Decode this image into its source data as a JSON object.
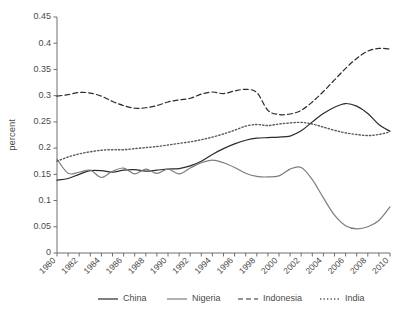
{
  "chart_data": {
    "type": "line",
    "title": "",
    "xlabel": "",
    "ylabel": "percent",
    "xlim": [
      1980,
      2010
    ],
    "ylim": [
      0,
      0.45
    ],
    "grid": false,
    "legend_position": "bottom",
    "y_ticks": [
      "0",
      "0.05",
      "0.1",
      "0.15",
      "0.2",
      "0.25",
      "0.3",
      "0.35",
      "0.4",
      "0.45"
    ],
    "y_tick_values": [
      0,
      0.05,
      0.1,
      0.15,
      0.2,
      0.25,
      0.3,
      0.35,
      0.4,
      0.45
    ],
    "x_tick_labels": [
      "1980",
      "1982",
      "1984",
      "1986",
      "1988",
      "1990",
      "1992",
      "1994",
      "1996",
      "1998",
      "2000",
      "2002",
      "2004",
      "2006",
      "2008",
      "2010"
    ],
    "x_tick_values": [
      1980,
      1982,
      1984,
      1986,
      1988,
      1990,
      1992,
      1994,
      1996,
      1998,
      2000,
      2002,
      2004,
      2006,
      2008,
      2010
    ],
    "x": [
      1980,
      1981,
      1982,
      1983,
      1984,
      1985,
      1986,
      1987,
      1988,
      1989,
      1990,
      1991,
      1992,
      1993,
      1994,
      1995,
      1996,
      1997,
      1998,
      1999,
      2000,
      2001,
      2002,
      2003,
      2004,
      2005,
      2006,
      2007,
      2008,
      2009,
      2010
    ],
    "series": [
      {
        "name": "China",
        "style": "solid",
        "color": "#2b2b2b",
        "values": [
          0.139,
          0.142,
          0.15,
          0.157,
          0.157,
          0.154,
          0.158,
          0.159,
          0.156,
          0.158,
          0.16,
          0.161,
          0.166,
          0.175,
          0.188,
          0.199,
          0.208,
          0.215,
          0.219,
          0.22,
          0.221,
          0.223,
          0.233,
          0.25,
          0.266,
          0.278,
          0.285,
          0.28,
          0.266,
          0.245,
          0.232
        ]
      },
      {
        "name": "Nigeria",
        "style": "solid",
        "color": "#7d7d7d",
        "values": [
          0.179,
          0.152,
          0.154,
          0.158,
          0.144,
          0.156,
          0.162,
          0.151,
          0.16,
          0.152,
          0.16,
          0.151,
          0.162,
          0.172,
          0.177,
          0.172,
          0.163,
          0.152,
          0.146,
          0.145,
          0.147,
          0.16,
          0.163,
          0.14,
          0.105,
          0.072,
          0.052,
          0.046,
          0.05,
          0.062,
          0.088
        ]
      },
      {
        "name": "Indonesia",
        "style": "dashed",
        "color": "#2b2b2b",
        "values": [
          0.299,
          0.302,
          0.306,
          0.305,
          0.299,
          0.289,
          0.281,
          0.276,
          0.277,
          0.281,
          0.288,
          0.292,
          0.295,
          0.303,
          0.307,
          0.304,
          0.309,
          0.312,
          0.306,
          0.272,
          0.264,
          0.265,
          0.272,
          0.288,
          0.308,
          0.33,
          0.352,
          0.371,
          0.385,
          0.39,
          0.389
        ]
      },
      {
        "name": "India",
        "style": "dotted",
        "color": "#5a5a5a",
        "values": [
          0.175,
          0.183,
          0.189,
          0.193,
          0.196,
          0.197,
          0.197,
          0.199,
          0.201,
          0.203,
          0.206,
          0.209,
          0.212,
          0.216,
          0.221,
          0.227,
          0.234,
          0.242,
          0.245,
          0.243,
          0.246,
          0.248,
          0.249,
          0.246,
          0.24,
          0.234,
          0.229,
          0.226,
          0.224,
          0.226,
          0.231
        ]
      }
    ]
  },
  "legend": {
    "items": [
      {
        "label": "China"
      },
      {
        "label": "Nigeria"
      },
      {
        "label": "Indonesia"
      },
      {
        "label": "India"
      }
    ]
  }
}
